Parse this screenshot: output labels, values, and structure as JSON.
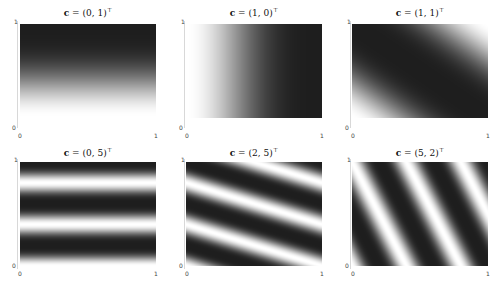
{
  "panels": [
    {
      "title_prefix": "c",
      "title_rest": " = (0, 1)",
      "title_sup": "⊤",
      "c": [
        0,
        1
      ]
    },
    {
      "title_prefix": "c",
      "title_rest": " = (1, 0)",
      "title_sup": "⊤",
      "c": [
        1,
        0
      ]
    },
    {
      "title_prefix": "c",
      "title_rest": " = (1, 1)",
      "title_sup": "⊤",
      "c": [
        1,
        1
      ]
    },
    {
      "title_prefix": "c",
      "title_rest": " = (0, 5)",
      "title_sup": "⊤",
      "c": [
        0,
        5
      ]
    },
    {
      "title_prefix": "c",
      "title_rest": " = (2, 5)",
      "title_sup": "⊤",
      "c": [
        2,
        5
      ]
    },
    {
      "title_prefix": "c",
      "title_rest": " = (5, 2)",
      "title_sup": "⊤",
      "c": [
        5,
        2
      ]
    }
  ],
  "ticks": {
    "x_min": "0",
    "x_max": "1",
    "y_min": "0",
    "y_max": "1"
  },
  "chart_data": [
    {
      "type": "heatmap",
      "title": "c = (0,1)^T",
      "function": "cos(pi*(c1*x + c2*y))",
      "c": [
        0,
        1
      ],
      "xlim": [
        0,
        1
      ],
      "ylim": [
        0,
        1
      ],
      "xticks": [
        "0",
        "1"
      ],
      "yticks": [
        "0",
        "1"
      ],
      "colormap": "gray",
      "grid": false
    },
    {
      "type": "heatmap",
      "title": "c = (1,0)^T",
      "function": "cos(pi*(c1*x + c2*y))",
      "c": [
        1,
        0
      ],
      "xlim": [
        0,
        1
      ],
      "ylim": [
        0,
        1
      ],
      "xticks": [
        "0",
        "1"
      ],
      "yticks": [
        "0",
        "1"
      ],
      "colormap": "gray",
      "grid": false
    },
    {
      "type": "heatmap",
      "title": "c = (1,1)^T",
      "function": "cos(pi*(c1*x + c2*y))",
      "c": [
        1,
        1
      ],
      "xlim": [
        0,
        1
      ],
      "ylim": [
        0,
        1
      ],
      "xticks": [
        "0",
        "1"
      ],
      "yticks": [
        "0",
        "1"
      ],
      "colormap": "gray",
      "grid": false
    },
    {
      "type": "heatmap",
      "title": "c = (0,5)^T",
      "function": "cos(pi*(c1*x + c2*y))",
      "c": [
        0,
        5
      ],
      "xlim": [
        0,
        1
      ],
      "ylim": [
        0,
        1
      ],
      "xticks": [
        "0",
        "1"
      ],
      "yticks": [
        "0",
        "1"
      ],
      "colormap": "gray",
      "grid": false
    },
    {
      "type": "heatmap",
      "title": "c = (2,5)^T",
      "function": "cos(pi*(c1*x + c2*y))",
      "c": [
        2,
        5
      ],
      "xlim": [
        0,
        1
      ],
      "ylim": [
        0,
        1
      ],
      "xticks": [
        "0",
        "1"
      ],
      "yticks": [
        "0",
        "1"
      ],
      "colormap": "gray",
      "grid": false
    },
    {
      "type": "heatmap",
      "title": "c = (5,2)^T",
      "function": "cos(pi*(c1*x + c2*y))",
      "c": [
        5,
        2
      ],
      "xlim": [
        0,
        1
      ],
      "ylim": [
        0,
        1
      ],
      "xticks": [
        "0",
        "1"
      ],
      "yticks": [
        "0",
        "1"
      ],
      "colormap": "gray",
      "grid": false
    }
  ],
  "style": {
    "dark_color": "#1e1e1e",
    "light_color": "#ffffff",
    "axis_color": "#d8d8d8"
  }
}
